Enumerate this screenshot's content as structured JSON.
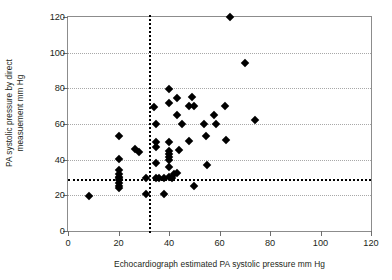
{
  "chart_data": {
    "type": "scatter",
    "title": "",
    "xlabel": "Echocardiograph estimated PA systolic pressure mm Hg",
    "ylabel_line1": "PA systolic pressure by direct",
    "ylabel_line2": "measuement mm Hg",
    "xlim": [
      0,
      120
    ],
    "ylim": [
      0,
      120
    ],
    "xticks": [
      0,
      20,
      40,
      60,
      80,
      100,
      120
    ],
    "yticks": [
      0,
      20,
      40,
      60,
      80,
      100,
      120
    ],
    "xtick_labels": [
      "0",
      "20",
      "40",
      "60",
      "80",
      "100",
      "120"
    ],
    "ytick_labels": [
      "0",
      "20",
      "40",
      "60",
      "80",
      "100",
      "120"
    ],
    "grid": "horizontal-dotted",
    "legend": "none",
    "marker": "filled-diamond",
    "marker_color": "#000000",
    "reference_lines": [
      {
        "orientation": "vertical",
        "value": 32,
        "style": "dotted",
        "color": "#000000"
      },
      {
        "orientation": "horizontal",
        "value": 29,
        "style": "dotted",
        "color": "#000000"
      }
    ],
    "points": [
      [
        8.5,
        19.5
      ],
      [
        20,
        53.5
      ],
      [
        20,
        40.5
      ],
      [
        20,
        34
      ],
      [
        20,
        32
      ],
      [
        20,
        30.5
      ],
      [
        20,
        29.5
      ],
      [
        20,
        28.5
      ],
      [
        20,
        27
      ],
      [
        20,
        25.5
      ],
      [
        20,
        24
      ],
      [
        26.5,
        46
      ],
      [
        28,
        44.5
      ],
      [
        31,
        30
      ],
      [
        31,
        21
      ],
      [
        34,
        69.5
      ],
      [
        35,
        60
      ],
      [
        35,
        50
      ],
      [
        35,
        47
      ],
      [
        35,
        38
      ],
      [
        35,
        30
      ],
      [
        36,
        30
      ],
      [
        38,
        21
      ],
      [
        38,
        30
      ],
      [
        40,
        79.5
      ],
      [
        40,
        71.5
      ],
      [
        40,
        50
      ],
      [
        40,
        45
      ],
      [
        40,
        43
      ],
      [
        40,
        41.5
      ],
      [
        40,
        40
      ],
      [
        40,
        36
      ],
      [
        40,
        30.5
      ],
      [
        41,
        30
      ],
      [
        42,
        32
      ],
      [
        43,
        74.5
      ],
      [
        43,
        65
      ],
      [
        43,
        32.5
      ],
      [
        44,
        45.5
      ],
      [
        45,
        60
      ],
      [
        48,
        70
      ],
      [
        48,
        50.5
      ],
      [
        49,
        75
      ],
      [
        50,
        70
      ],
      [
        50,
        25
      ],
      [
        54,
        60
      ],
      [
        54.5,
        53
      ],
      [
        55,
        37
      ],
      [
        58,
        65
      ],
      [
        58.5,
        60
      ],
      [
        62,
        70
      ],
      [
        62.5,
        51
      ],
      [
        64,
        120
      ],
      [
        70,
        94
      ],
      [
        74,
        62
      ]
    ]
  }
}
